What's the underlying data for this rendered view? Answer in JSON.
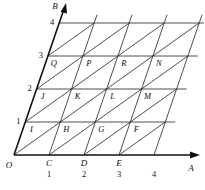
{
  "diagram": {
    "type": "oblique-grid",
    "axes": {
      "x_axis_label": "A",
      "y_axis_label": "B",
      "origin_label": "O"
    },
    "x_ticks": [
      {
        "letter": "C",
        "number": "1"
      },
      {
        "letter": "D",
        "number": "2"
      },
      {
        "letter": "E",
        "number": "3"
      },
      {
        "letter": "",
        "number": "4"
      }
    ],
    "y_ticks": [
      "1",
      "2",
      "3",
      "4"
    ],
    "cell_labels": {
      "row1": [
        "I",
        "H",
        "G",
        "F"
      ],
      "row2": [
        "J",
        "K",
        "L",
        "M"
      ],
      "row3": [
        "Q",
        "P",
        "R",
        "N"
      ]
    }
  }
}
